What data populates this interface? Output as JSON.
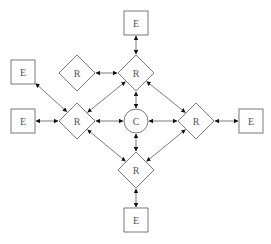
{
  "diagram": {
    "type": "network-topology",
    "colors": {
      "stroke": "#6b6b6b",
      "arrow": "#111111",
      "text": "#555555",
      "background": "#ffffff"
    },
    "nodes": [
      {
        "id": "e_top",
        "shape": "square",
        "label": "E",
        "cx": 136,
        "cy": 23
      },
      {
        "id": "r_top",
        "shape": "diamond",
        "label": "R",
        "cx": 136,
        "cy": 73
      },
      {
        "id": "r_left_top",
        "shape": "diamond",
        "label": "R",
        "cx": 77,
        "cy": 73
      },
      {
        "id": "e_left_top",
        "shape": "square",
        "label": "E",
        "cx": 23,
        "cy": 72
      },
      {
        "id": "r_left",
        "shape": "diamond",
        "label": "R",
        "cx": 77,
        "cy": 121
      },
      {
        "id": "e_left",
        "shape": "square",
        "label": "E",
        "cx": 23,
        "cy": 121
      },
      {
        "id": "c_center",
        "shape": "circle",
        "label": "C",
        "cx": 136,
        "cy": 121
      },
      {
        "id": "r_right",
        "shape": "diamond",
        "label": "R",
        "cx": 196,
        "cy": 121
      },
      {
        "id": "e_right",
        "shape": "square",
        "label": "E",
        "cx": 251,
        "cy": 121
      },
      {
        "id": "r_bottom",
        "shape": "diamond",
        "label": "R",
        "cx": 136,
        "cy": 170
      },
      {
        "id": "e_bottom",
        "shape": "square",
        "label": "E",
        "cx": 136,
        "cy": 220
      }
    ],
    "edges": [
      {
        "from": "e_top",
        "to": "r_top",
        "bidirectional": true
      },
      {
        "from": "r_left_top",
        "to": "r_top",
        "bidirectional": true
      },
      {
        "from": "r_top",
        "to": "c_center",
        "bidirectional": true
      },
      {
        "from": "r_top",
        "to": "r_left",
        "bidirectional": true
      },
      {
        "from": "r_top",
        "to": "r_right",
        "bidirectional": true
      },
      {
        "from": "e_left_top",
        "to": "r_left",
        "bidirectional": true
      },
      {
        "from": "e_left",
        "to": "r_left",
        "bidirectional": true
      },
      {
        "from": "r_left",
        "to": "c_center",
        "bidirectional": true
      },
      {
        "from": "c_center",
        "to": "r_right",
        "bidirectional": true
      },
      {
        "from": "r_right",
        "to": "e_right",
        "bidirectional": true
      },
      {
        "from": "c_center",
        "to": "r_bottom",
        "bidirectional": true
      },
      {
        "from": "r_left",
        "to": "r_bottom",
        "bidirectional": true
      },
      {
        "from": "r_right",
        "to": "r_bottom",
        "bidirectional": true
      },
      {
        "from": "r_bottom",
        "to": "e_bottom",
        "bidirectional": true
      }
    ]
  }
}
